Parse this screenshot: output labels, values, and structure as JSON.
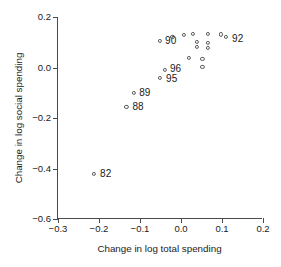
{
  "chart_data": {
    "type": "scatter",
    "title": "",
    "xlabel": "Change in log total spending",
    "ylabel": "Change in log social spending",
    "xlim": [
      -0.3,
      0.2
    ],
    "ylim": [
      -0.6,
      0.2
    ],
    "xticks": [
      -0.3,
      -0.2,
      -0.1,
      0.0,
      0.1,
      0.2
    ],
    "xticklabels": [
      "−0.3",
      "−0.2",
      "−0.1",
      "0.0",
      "0.1",
      "0.2"
    ],
    "yticks": [
      -0.6,
      -0.4,
      -0.2,
      0.0,
      0.2
    ],
    "yticklabels": [
      "−0.6",
      "−0.4",
      "−0.2",
      "0.0",
      "0.2"
    ],
    "grid": false,
    "legend": null,
    "marker": "open-circle",
    "points": [
      {
        "x": -0.212,
        "y": -0.42,
        "label": "82",
        "label_dx": 6,
        "label_dy": 0
      },
      {
        "x": -0.133,
        "y": -0.157,
        "label": "88",
        "label_dx": 6,
        "label_dy": 0
      },
      {
        "x": -0.114,
        "y": -0.1,
        "label": "89",
        "label_dx": 5,
        "label_dy": 0
      },
      {
        "x": -0.051,
        "y": -0.04,
        "label": "95",
        "label_dx": 6,
        "label_dy": 1
      },
      {
        "x": -0.039,
        "y": -0.008,
        "label": "96",
        "label_dx": 5,
        "label_dy": -1
      },
      {
        "x": -0.051,
        "y": 0.105,
        "label": "90",
        "label_dx": 5,
        "label_dy": 0
      },
      {
        "x": 0.11,
        "y": 0.122,
        "label": "92",
        "label_dx": 6,
        "label_dy": 2
      },
      {
        "x": -0.021,
        "y": 0.12,
        "label": "",
        "label_dx": 0,
        "label_dy": 0
      },
      {
        "x": 0.008,
        "y": 0.128,
        "label": "",
        "label_dx": 0,
        "label_dy": 0
      },
      {
        "x": 0.03,
        "y": 0.132,
        "label": "",
        "label_dx": 0,
        "label_dy": 0
      },
      {
        "x": 0.038,
        "y": 0.1,
        "label": "",
        "label_dx": 0,
        "label_dy": 0
      },
      {
        "x": 0.038,
        "y": 0.082,
        "label": "",
        "label_dx": 0,
        "label_dy": 0
      },
      {
        "x": 0.065,
        "y": 0.133,
        "label": "",
        "label_dx": 0,
        "label_dy": 0
      },
      {
        "x": 0.066,
        "y": 0.098,
        "label": "",
        "label_dx": 0,
        "label_dy": 0
      },
      {
        "x": 0.066,
        "y": 0.078,
        "label": "",
        "label_dx": 0,
        "label_dy": 0
      },
      {
        "x": 0.098,
        "y": 0.131,
        "label": "",
        "label_dx": 0,
        "label_dy": 0
      },
      {
        "x": 0.019,
        "y": 0.038,
        "label": "",
        "label_dx": 0,
        "label_dy": 0
      },
      {
        "x": 0.052,
        "y": 0.035,
        "label": "",
        "label_dx": 0,
        "label_dy": 0
      },
      {
        "x": 0.052,
        "y": 0.002,
        "label": "",
        "label_dx": 0,
        "label_dy": 0
      }
    ]
  }
}
